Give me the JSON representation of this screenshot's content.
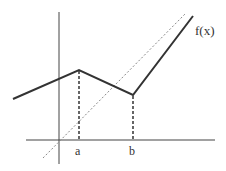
{
  "diagram": {
    "function_label": "f(x)",
    "labels": {
      "a": "a",
      "b": "b"
    },
    "colors": {
      "axis": "#444444",
      "function": "#333333",
      "dashed": "#333333",
      "dotted_line": "#888888"
    },
    "points": {
      "left_end": [
        13,
        99
      ],
      "peak_a": [
        79,
        70
      ],
      "valley_b": [
        133,
        95
      ],
      "right_end": [
        193,
        16
      ]
    },
    "axes": {
      "vertical": {
        "x": 59,
        "y_top": 12,
        "y_bottom": 164
      },
      "horizontal": {
        "y": 140,
        "x_left": 26,
        "x_right": 215
      }
    }
  }
}
